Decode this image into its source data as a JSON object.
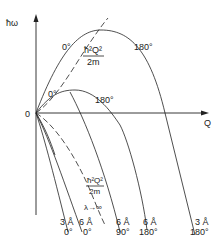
{
  "diagram": {
    "y_axis_label": "ħω",
    "x_axis_label": "Q",
    "origin_label": "0",
    "upper_curve": {
      "left_label": "0°",
      "right_label": "180°"
    },
    "middle_curve": {
      "left_label": "0°",
      "right_label": "180°"
    },
    "free_particle_upper": {
      "numerator": "ħ²Q²",
      "denominator": "2m"
    },
    "free_particle_lower": {
      "numerator": "ħ²Q²",
      "denominator": "2m",
      "limit_label": "λ→∞"
    },
    "bottom_labels": [
      {
        "wavelength": "3 Å",
        "angle": "0°"
      },
      {
        "wavelength": "6 Å",
        "angle": "0°"
      },
      {
        "wavelength": "6 Å",
        "angle": "90°"
      },
      {
        "wavelength": "6 Å",
        "angle": "180°"
      },
      {
        "wavelength": "3 Å",
        "angle": "180°"
      }
    ]
  }
}
